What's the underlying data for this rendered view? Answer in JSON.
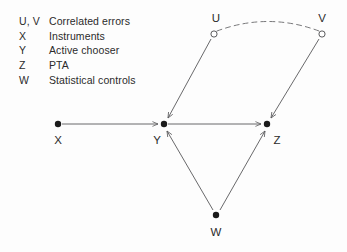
{
  "diagram": {
    "background_color": "#fdfdfd",
    "stroke_color": "#58585a",
    "text_color": "#2b2b2b",
    "node_fill_color": "#1a1a1a",
    "legend": [
      {
        "symbol": "U, V",
        "description": "Correlated errors"
      },
      {
        "symbol": "X",
        "description": "Instruments"
      },
      {
        "symbol": "Y",
        "description": "Active chooser"
      },
      {
        "symbol": "Z",
        "description": "PTA"
      },
      {
        "symbol": "W",
        "description": "Statistical controls"
      }
    ],
    "nodes": [
      {
        "id": "U",
        "label": "U",
        "x": 214,
        "y": 34,
        "style": "hollow",
        "label_x": 216,
        "label_y": 14
      },
      {
        "id": "V",
        "label": "V",
        "x": 322,
        "y": 34,
        "style": "hollow",
        "label_x": 322,
        "label_y": 14
      },
      {
        "id": "X",
        "label": "X",
        "x": 58,
        "y": 124,
        "style": "filled",
        "label_x": 58,
        "label_y": 135
      },
      {
        "id": "Y",
        "label": "Y",
        "x": 164,
        "y": 124,
        "style": "filled",
        "label_x": 157,
        "label_y": 135
      },
      {
        "id": "Z",
        "label": "Z",
        "x": 267,
        "y": 124,
        "style": "filled",
        "label_x": 277,
        "label_y": 135
      },
      {
        "id": "W",
        "label": "W",
        "x": 216,
        "y": 215,
        "style": "filled",
        "label_x": 216,
        "label_y": 227
      }
    ],
    "edges": [
      {
        "from": "X",
        "to": "Y",
        "kind": "directed-arrow"
      },
      {
        "from": "Y",
        "to": "Z",
        "kind": "directed-arrow"
      },
      {
        "from": "U",
        "to": "Y",
        "kind": "directed-arrow"
      },
      {
        "from": "V",
        "to": "Z",
        "kind": "directed-arrow"
      },
      {
        "from": "W",
        "to": "Y",
        "kind": "directed-arrow"
      },
      {
        "from": "W",
        "to": "Z",
        "kind": "directed-arrow"
      },
      {
        "from": "U",
        "to": "V",
        "kind": "dashed-arc",
        "note": "correlation between errors"
      }
    ]
  }
}
